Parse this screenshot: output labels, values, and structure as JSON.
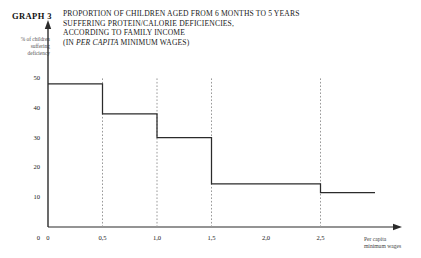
{
  "figure": {
    "graph_label": "GRAPH 3",
    "title_lines": [
      "PROPORTION OF CHILDREN AGED FROM 6 MONTHS TO 5 YEARS",
      "SUFFERING PROTEIN/CALORIE DEFICIENCIES,",
      "ACCORDING TO FAMILY INCOME"
    ],
    "title_line_4_prefix": "(IN ",
    "title_line_4_italic": "PER CAPITA",
    "title_line_4_suffix": " MINIMUM WAGES)",
    "y_caption_lines": [
      "% of children",
      "suffering",
      "deficiency"
    ],
    "x_caption_lines": [
      "Per capita",
      "minimum wages"
    ]
  },
  "chart_data": {
    "type": "bar",
    "title": "PROPORTION OF CHILDREN AGED FROM 6 MONTHS TO 5 YEARS SUFFERING PROTEIN/CALORIE DEFICIENCIES, ACCORDING TO FAMILY INCOME (IN PER CAPITA MINIMUM WAGES)",
    "xlabel": "Per capita minimum wages",
    "ylabel": "% of children suffering deficiency",
    "xlim": [
      0,
      3.0
    ],
    "ylim": [
      0,
      52
    ],
    "grid": false,
    "legend": "none",
    "style": "step",
    "x_ticks": [
      0,
      0.5,
      1.0,
      1.5,
      2.0,
      2.5
    ],
    "x_tick_labels": [
      "0",
      "0,5",
      "1,0",
      "1,5",
      "2,0",
      "2,5"
    ],
    "y_ticks": [
      0,
      10,
      20,
      30,
      40,
      50
    ],
    "y_tick_labels": [
      "0",
      "10",
      "20",
      "30",
      "40",
      "50"
    ],
    "bins": [
      {
        "x_start": 0,
        "x_end": 0.5,
        "value": 48
      },
      {
        "x_start": 0.5,
        "x_end": 1.0,
        "value": 38
      },
      {
        "x_start": 1.0,
        "x_end": 1.5,
        "value": 30
      },
      {
        "x_start": 1.5,
        "x_end": 2.5,
        "value": 14.5
      },
      {
        "x_start": 2.5,
        "x_end": 3.0,
        "value": 11.5
      }
    ],
    "categories": [
      "0-0,5",
      "0,5-1,0",
      "1,0-1,5",
      "1,5-2,5",
      "2,5+"
    ],
    "values": [
      48,
      38,
      30,
      14.5,
      11.5
    ],
    "dropline_positions": [
      0.5,
      1.0,
      1.5,
      2.5
    ]
  }
}
